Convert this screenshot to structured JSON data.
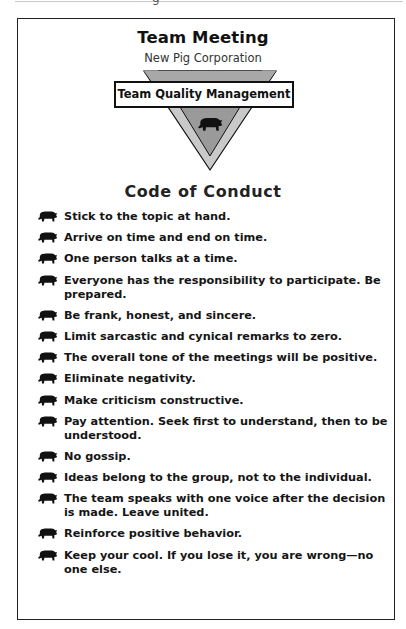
{
  "header": {
    "cutoff_glyph": "g",
    "title": "Team Meeting",
    "subtitle": "New Pig Corporation"
  },
  "logo": {
    "label": "Team Quality Management",
    "icon": "pig-icon",
    "colors": {
      "outer_band": "#c9c9c9",
      "inner_fill": "#9a9a9a",
      "outline": "#111111"
    }
  },
  "section": {
    "heading": "Code of Conduct",
    "bullet_icon": "pig-icon",
    "rules": [
      "Stick to the topic at hand.",
      "Arrive on time and end on time.",
      "One person talks at a time.",
      "Everyone has the responsibility to participate. Be prepared.",
      "Be frank, honest, and sincere.",
      "Limit sarcastic and cynical remarks to zero.",
      "The overall tone of the meetings will be positive.",
      "Eliminate negativity.",
      "Make criticism constructive.",
      "Pay attention. Seek first to understand, then to be understood.",
      "No gossip.",
      "Ideas belong to the group, not to the individual.",
      "The team speaks with one voice after the decision is made. Leave united.",
      "Reinforce positive behavior.",
      "Keep your cool. If you lose it, you are wrong—no one else."
    ]
  }
}
